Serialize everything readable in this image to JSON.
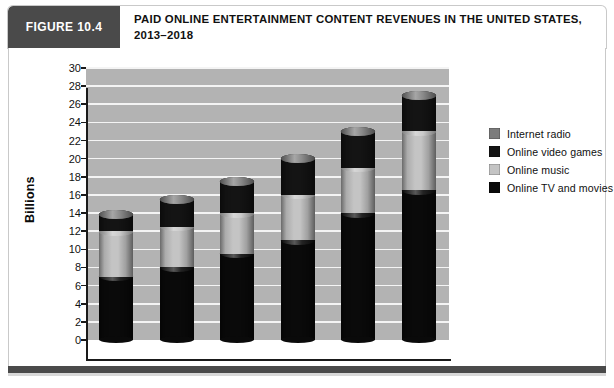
{
  "figure": {
    "tag": "FIGURE 10.4",
    "title_line1": "PAID ONLINE ENTERTAINMENT CONTENT REVENUES IN THE UNITED STATES,",
    "title_line2": "2013–2018"
  },
  "colors": {
    "tag_background": "#4a4a4a",
    "plot_background": "#b3b3b3",
    "gridline": "#f4f4f4",
    "axis": "#1a1a1a",
    "internet_radio": "#7c7c7c",
    "online_video_games": "#141414",
    "online_music": "#c4c4c4",
    "online_tv_and_movies": "#0a0a0a"
  },
  "chart_data": {
    "type": "bar",
    "subtype": "stacked-cylinder-3d",
    "title": "PAID ONLINE ENTERTAINMENT CONTENT REVENUES IN THE UNITED STATES, 2013–2018",
    "xlabel": "",
    "ylabel": "Billions",
    "ylim": [
      0,
      30
    ],
    "ytick_step": 2,
    "yticks": [
      30,
      28,
      26,
      24,
      22,
      20,
      18,
      16,
      14,
      12,
      10,
      8,
      6,
      4,
      2,
      0
    ],
    "grid": true,
    "legend_position": "right",
    "categories": [
      "2013",
      "2014",
      "2015",
      "2016",
      "2017",
      "2018"
    ],
    "series": [
      {
        "name": "Online TV and movies",
        "color": "#0a0a0a",
        "values": [
          7.0,
          8.0,
          9.5,
          11.0,
          14.0,
          16.5
        ]
      },
      {
        "name": "Online music",
        "color": "#c4c4c4",
        "values": [
          5.0,
          4.5,
          4.5,
          5.0,
          5.0,
          6.5
        ]
      },
      {
        "name": "Online video games",
        "color": "#141414",
        "values": [
          1.8,
          3.0,
          3.5,
          4.0,
          4.0,
          4.0
        ]
      },
      {
        "name": "Internet radio",
        "color": "#7c7c7c",
        "values": [
          0.0,
          0.0,
          0.0,
          0.0,
          0.0,
          0.0
        ]
      }
    ],
    "totals": [
      13.8,
      15.5,
      17.5,
      20.0,
      23.0,
      27.0
    ],
    "legend_order": [
      "Internet radio",
      "Online video games",
      "Online music",
      "Online TV and movies"
    ]
  }
}
